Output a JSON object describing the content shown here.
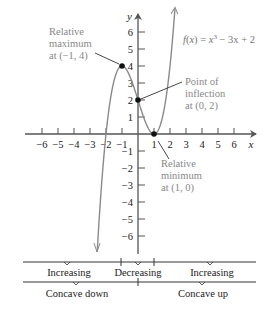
{
  "figure": {
    "function_label": {
      "prefix": "f(x) = x",
      "exp": "3",
      "suffix": " − 3x + 2"
    },
    "axes": {
      "x_label": "x",
      "y_label": "y",
      "x_ticks": [
        "−6",
        "−5",
        "−4",
        "−3",
        "−2",
        "−1",
        "1",
        "2",
        "3",
        "4",
        "5",
        "6"
      ],
      "y_ticks": [
        "6",
        "5",
        "4",
        "3",
        "2",
        "1",
        "−1",
        "−2",
        "−3",
        "−4",
        "−5",
        "−6"
      ]
    },
    "annotations": {
      "max": {
        "line1": "Relative",
        "line2": "maximum",
        "line3": "at (−1, 4)"
      },
      "inflection": {
        "line1": "Point of",
        "line2": "inflection",
        "line3": "at (0, 2)"
      },
      "min": {
        "line1": "Relative",
        "line2": "minimum",
        "line3": "at (1, 0)"
      }
    },
    "intervals_monotonic": [
      "Increasing",
      "Decreasing",
      "Increasing"
    ],
    "intervals_concavity": [
      "Concave down",
      "Concave up"
    ],
    "colors": {
      "curve": "#8a8a8a",
      "axis": "#555555",
      "annotation": "#888888",
      "text": "#222222"
    }
  }
}
